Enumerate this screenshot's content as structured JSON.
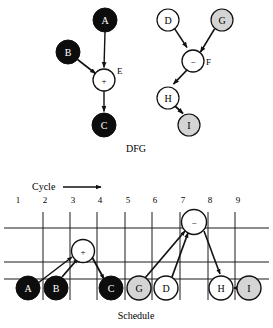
{
  "figure": {
    "caption_dfg": "DFG",
    "caption_schedule": "Schedule",
    "cycle_label": "Cycle",
    "colors": {
      "filled_black": "#0d0d0d",
      "filled_gray": "#d4d4d4",
      "filled_white": "#ffffff",
      "stroke": "#111111",
      "grid": "#1a1a1a",
      "label_light": "#ffffff",
      "label_dark": "#000000"
    }
  },
  "dfg": {
    "left_tree": {
      "nodes": [
        {
          "id": "A",
          "label": "A",
          "fill": "black",
          "cx": 105,
          "cy": 20,
          "r": 12
        },
        {
          "id": "B",
          "label": "B",
          "fill": "black",
          "cx": 68,
          "cy": 52,
          "r": 12
        },
        {
          "id": "E",
          "label": "+",
          "fill": "white",
          "cx": 104,
          "cy": 80,
          "r": 11,
          "edge_label": "E"
        },
        {
          "id": "C",
          "label": "C",
          "fill": "black",
          "cx": 104,
          "cy": 125,
          "r": 12
        }
      ],
      "edges": [
        {
          "from": "A",
          "to": "E"
        },
        {
          "from": "B",
          "to": "E"
        },
        {
          "from": "E",
          "to": "C"
        }
      ]
    },
    "right_tree": {
      "nodes": [
        {
          "id": "D",
          "label": "D",
          "fill": "white",
          "cx": 168,
          "cy": 20,
          "r": 11
        },
        {
          "id": "G",
          "label": "G",
          "fill": "gray",
          "cx": 222,
          "cy": 20,
          "r": 11
        },
        {
          "id": "F",
          "label": "−",
          "fill": "white",
          "cx": 193,
          "cy": 61,
          "r": 11,
          "edge_label": "F"
        },
        {
          "id": "H",
          "label": "H",
          "fill": "white",
          "cx": 168,
          "cy": 98,
          "r": 11
        },
        {
          "id": "I",
          "label": "I",
          "fill": "gray",
          "cx": 189,
          "cy": 125,
          "r": 11
        }
      ],
      "edges": [
        {
          "from": "D",
          "to": "F"
        },
        {
          "from": "G",
          "to": "F"
        },
        {
          "from": "F",
          "to": "H"
        },
        {
          "from": "H",
          "to": "I"
        }
      ]
    }
  },
  "schedule": {
    "cycles": [
      "1",
      "2",
      "3",
      "4",
      "5",
      "6",
      "7",
      "8",
      "9"
    ],
    "tick_x": [
      18,
      45,
      73,
      100,
      128,
      155,
      183,
      210,
      238
    ],
    "grid_vertical_x": [
      43,
      70,
      97,
      125,
      152,
      180,
      208,
      235
    ],
    "grid_horizontal_y": [
      228,
      262,
      279
    ],
    "grid_top_y": 212,
    "grid_bottom_y": 300,
    "nodes": [
      {
        "id": "A",
        "label": "A",
        "fill": "black",
        "cx": 28,
        "cy": 288,
        "r": 12,
        "cycle": 1
      },
      {
        "id": "B",
        "label": "B",
        "fill": "black",
        "cx": 56,
        "cy": 288,
        "r": 12,
        "cycle": 2
      },
      {
        "id": "E",
        "label": "+",
        "fill": "white",
        "cx": 83,
        "cy": 251,
        "r": 11,
        "cycle": 3
      },
      {
        "id": "C",
        "label": "C",
        "fill": "black",
        "cx": 111,
        "cy": 288,
        "r": 12,
        "cycle": 4
      },
      {
        "id": "G",
        "label": "G",
        "fill": "gray",
        "cx": 139,
        "cy": 288,
        "r": 12,
        "cycle": 5
      },
      {
        "id": "D",
        "label": "D",
        "fill": "white",
        "cx": 166,
        "cy": 288,
        "r": 12,
        "cycle": 6
      },
      {
        "id": "F",
        "label": "−",
        "fill": "white",
        "cx": 194,
        "cy": 222,
        "r": 12,
        "cycle": 7
      },
      {
        "id": "H",
        "label": "H",
        "fill": "white",
        "cx": 221,
        "cy": 288,
        "r": 12,
        "cycle": 8
      },
      {
        "id": "I",
        "label": "I",
        "fill": "gray",
        "cx": 249,
        "cy": 288,
        "r": 12,
        "cycle": 9
      }
    ],
    "edges": [
      {
        "from": "A",
        "to": "E"
      },
      {
        "from": "B",
        "to": "E"
      },
      {
        "from": "E",
        "to": "C"
      },
      {
        "from": "G",
        "to": "F"
      },
      {
        "from": "D",
        "to": "F"
      },
      {
        "from": "F",
        "to": "H"
      },
      {
        "from": "H",
        "to": "I"
      }
    ],
    "arrow": {
      "x1": 63,
      "x2": 103,
      "y": 190
    }
  }
}
